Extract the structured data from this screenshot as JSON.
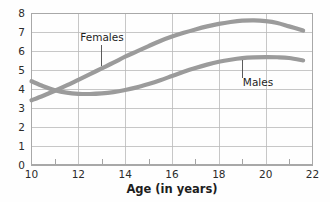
{
  "chart_data": {
    "type": "line",
    "title": "",
    "subtitle": "",
    "xlabel": "Age (in years)",
    "ylabel": "",
    "xlim": [
      10,
      22
    ],
    "ylim": [
      0,
      8
    ],
    "x_ticks": [
      10,
      12,
      14,
      16,
      18,
      20,
      22
    ],
    "x_tick_labels": [
      "10",
      "12",
      "14",
      "16",
      "18",
      "20",
      "22"
    ],
    "x_minor_ticks": [
      11,
      13,
      15,
      17,
      19,
      21
    ],
    "y_ticks": [
      0,
      1,
      2,
      3,
      4,
      5,
      6,
      7,
      8
    ],
    "y_tick_labels": [
      "0",
      "1",
      "2",
      "3",
      "4",
      "5",
      "6",
      "7",
      "8"
    ],
    "grid": "both",
    "legend_position": "inline-annotation",
    "curve_color": "#9b9b9b",
    "curve_width": 4.2,
    "series": [
      {
        "name": "Females",
        "label": "Females",
        "x": [
          10,
          10.5,
          11,
          11.5,
          12,
          12.5,
          13,
          13.5,
          14,
          14.5,
          15,
          15.5,
          16,
          16.5,
          17,
          17.5,
          18,
          18.5,
          19,
          19.5,
          20,
          20.5,
          21,
          21.6
        ],
        "values": [
          3.42,
          3.66,
          3.92,
          4.2,
          4.5,
          4.8,
          5.1,
          5.4,
          5.72,
          6.0,
          6.28,
          6.55,
          6.78,
          6.98,
          7.16,
          7.32,
          7.45,
          7.55,
          7.62,
          7.64,
          7.6,
          7.5,
          7.32,
          7.1
        ]
      },
      {
        "name": "Males",
        "label": "Males",
        "x": [
          10,
          10.5,
          11,
          11.5,
          12,
          12.5,
          13,
          13.5,
          14,
          14.5,
          15,
          15.5,
          16,
          16.5,
          17,
          17.5,
          18,
          18.5,
          19,
          19.5,
          20,
          20.5,
          21,
          21.6
        ],
        "values": [
          4.42,
          4.16,
          3.95,
          3.82,
          3.76,
          3.75,
          3.78,
          3.85,
          3.96,
          4.1,
          4.28,
          4.48,
          4.7,
          4.92,
          5.12,
          5.3,
          5.45,
          5.56,
          5.64,
          5.68,
          5.7,
          5.69,
          5.65,
          5.52
        ]
      }
    ],
    "annotations": [
      {
        "text": "Females",
        "target_series": "Females",
        "target_x": 13,
        "target_y": 5.1
      },
      {
        "text": "Males",
        "target_series": "Males",
        "target_x": 19,
        "target_y": 5.64
      }
    ]
  }
}
